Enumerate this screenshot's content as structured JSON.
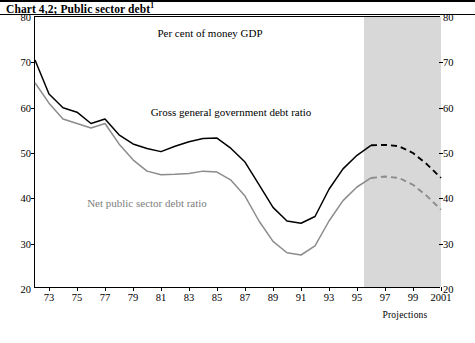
{
  "title": {
    "text": "Chart 4,2; Public sector debt",
    "superscript": "1"
  },
  "chart_data": {
    "type": "line",
    "title": "Chart 4,2; Public sector debt",
    "subtitle": "Per cent of money GDP",
    "xlabel": "",
    "ylabel": "",
    "ylim": [
      20,
      80
    ],
    "yticks": [
      20,
      30,
      40,
      50,
      60,
      70,
      80
    ],
    "xlim": [
      1972,
      2001
    ],
    "xticks": [
      73,
      75,
      77,
      79,
      81,
      83,
      85,
      87,
      89,
      91,
      93,
      95,
      97,
      99,
      2001
    ],
    "xtick_labels": [
      "73",
      "75",
      "77",
      "79",
      "81",
      "83",
      "85",
      "87",
      "89",
      "91",
      "93",
      "95",
      "97",
      "99",
      "2001"
    ],
    "grid": false,
    "legend_position": "inline-annotations",
    "annotations": [
      {
        "text": "Per cent of money GDP",
        "x": 1984.5,
        "y": 76.5
      },
      {
        "text": "Gross general government debt ratio",
        "x": 1986.0,
        "y": 59.0
      },
      {
        "text": "Net public sector debt ratio",
        "x": 1980.0,
        "y": 39.0
      },
      {
        "text": "Projections",
        "x": 1998.5,
        "y": 17.0
      }
    ],
    "shaded_region": {
      "label": "Projections",
      "x_start": 1995.5,
      "x_end": 2001.5,
      "color": "#d8d8d8"
    },
    "series": [
      {
        "name": "Gross general government debt ratio",
        "color": "#000000",
        "style": "solid",
        "x": [
          1972,
          1973,
          1974,
          1975,
          1976,
          1977,
          1978,
          1979,
          1980,
          1981,
          1982,
          1983,
          1984,
          1985,
          1986,
          1987,
          1988,
          1989,
          1990,
          1991,
          1992,
          1993,
          1994,
          1995,
          1996
        ],
        "values": [
          70.5,
          63.0,
          60.0,
          59.0,
          56.5,
          57.5,
          54.0,
          52.0,
          51.0,
          50.3,
          51.5,
          52.5,
          53.2,
          53.3,
          51.0,
          48.0,
          43.0,
          38.0,
          35.0,
          34.5,
          36.0,
          42.0,
          46.5,
          49.5,
          51.7
        ]
      },
      {
        "name": "Gross general government debt ratio (projection)",
        "color": "#000000",
        "style": "dashed",
        "x": [
          1996,
          1997,
          1998,
          1999,
          2000,
          2001
        ],
        "values": [
          51.7,
          51.8,
          51.5,
          50.0,
          47.5,
          44.5
        ]
      },
      {
        "name": "Net public sector debt ratio",
        "color": "#8c8c8c",
        "style": "solid",
        "x": [
          1972,
          1973,
          1974,
          1975,
          1976,
          1977,
          1978,
          1979,
          1980,
          1981,
          1982,
          1983,
          1984,
          1985,
          1986,
          1987,
          1988,
          1989,
          1990,
          1991,
          1992,
          1993,
          1994,
          1995,
          1996
        ],
        "values": [
          65.5,
          61.0,
          57.5,
          56.5,
          55.5,
          56.5,
          52.0,
          48.5,
          46.0,
          45.2,
          45.3,
          45.5,
          46.0,
          45.8,
          44.0,
          40.5,
          35.0,
          30.5,
          28.0,
          27.5,
          29.5,
          35.0,
          39.5,
          42.5,
          44.5
        ]
      },
      {
        "name": "Net public sector debt ratio (projection)",
        "color": "#8c8c8c",
        "style": "dashed",
        "x": [
          1996,
          1997,
          1998,
          1999,
          2000,
          2001
        ],
        "values": [
          44.5,
          44.8,
          44.5,
          43.0,
          40.5,
          37.5
        ]
      }
    ]
  }
}
